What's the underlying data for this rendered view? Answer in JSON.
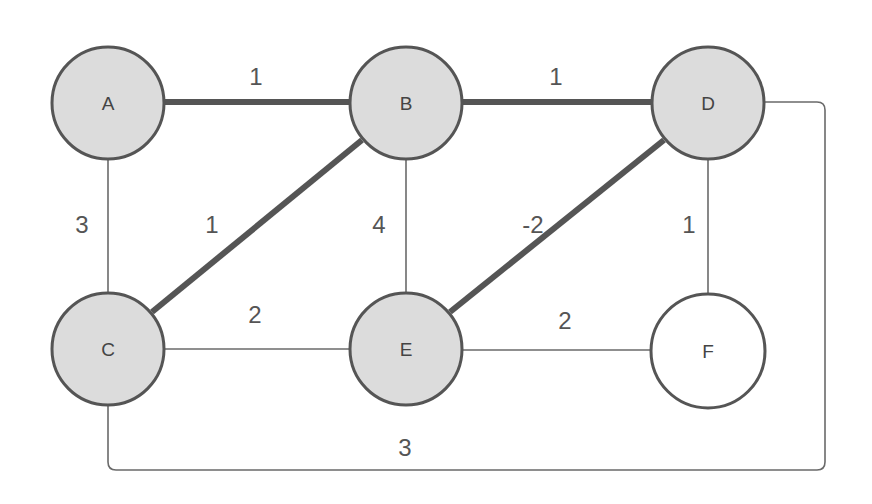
{
  "diagram": {
    "type": "weighted-graph",
    "colors": {
      "visited_fill": "#dcdcdc",
      "unvisited_fill": "#ffffff",
      "stroke": "#555555",
      "thin_edge": "#6a6a6a",
      "thick_edge": "#555555"
    },
    "nodes": [
      {
        "id": "A",
        "label": "A",
        "x": 108,
        "y": 103,
        "r": 56,
        "highlighted": true
      },
      {
        "id": "B",
        "label": "B",
        "x": 406,
        "y": 103,
        "r": 56,
        "highlighted": true
      },
      {
        "id": "D",
        "label": "D",
        "x": 708,
        "y": 103,
        "r": 56,
        "highlighted": true
      },
      {
        "id": "C",
        "label": "C",
        "x": 108,
        "y": 349,
        "r": 56,
        "highlighted": true
      },
      {
        "id": "E",
        "label": "E",
        "x": 406,
        "y": 349,
        "r": 56,
        "highlighted": true
      },
      {
        "id": "F",
        "label": "F",
        "x": 708,
        "y": 351,
        "r": 57,
        "highlighted": false
      }
    ],
    "edges": [
      {
        "from": "A",
        "to": "B",
        "weight": "1",
        "highlighted": true,
        "label_x": 256,
        "label_y": 76
      },
      {
        "from": "B",
        "to": "D",
        "weight": "1",
        "highlighted": true,
        "label_x": 556,
        "label_y": 76
      },
      {
        "from": "A",
        "to": "C",
        "weight": "3",
        "highlighted": false,
        "label_x": 82,
        "label_y": 224
      },
      {
        "from": "B",
        "to": "C",
        "weight": "1",
        "highlighted": true,
        "label_x": 212,
        "label_y": 224
      },
      {
        "from": "B",
        "to": "E",
        "weight": "4",
        "highlighted": false,
        "label_x": 379,
        "label_y": 224
      },
      {
        "from": "D",
        "to": "E",
        "weight": "-2",
        "highlighted": true,
        "label_x": 533,
        "label_y": 224
      },
      {
        "from": "D",
        "to": "F",
        "weight": "1",
        "highlighted": false,
        "label_x": 689,
        "label_y": 224
      },
      {
        "from": "C",
        "to": "E",
        "weight": "2",
        "highlighted": false,
        "label_x": 255,
        "label_y": 314
      },
      {
        "from": "E",
        "to": "F",
        "weight": "2",
        "highlighted": false,
        "label_x": 565,
        "label_y": 320
      },
      {
        "from": "D",
        "to": "C",
        "weight": "3",
        "highlighted": false,
        "label_x": 405,
        "label_y": 447,
        "routed": true
      }
    ]
  }
}
